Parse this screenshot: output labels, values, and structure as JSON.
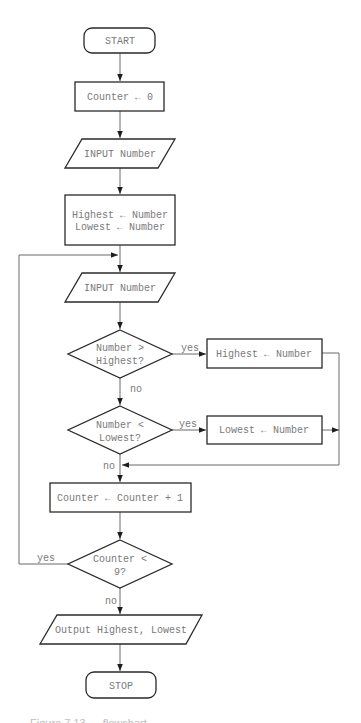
{
  "diagram": {
    "type": "flowchart",
    "nodes": {
      "start": {
        "shape": "terminator",
        "label": "START"
      },
      "init_counter": {
        "shape": "process",
        "label": "Counter ← 0"
      },
      "input_first": {
        "shape": "io",
        "label": "INPUT Number"
      },
      "init_minmax": {
        "shape": "process",
        "line1": "Highest ← Number",
        "line2": "Lowest ← Number"
      },
      "input_loop": {
        "shape": "io",
        "label": "INPUT Number"
      },
      "check_high": {
        "shape": "decision",
        "line1": "Number >",
        "line2": "Highest?"
      },
      "set_high": {
        "shape": "process",
        "label": "Highest ← Number"
      },
      "check_low": {
        "shape": "decision",
        "line1": "Number <",
        "line2": "Lowest?"
      },
      "set_low": {
        "shape": "process",
        "label": "Lowest ← Number"
      },
      "inc_counter": {
        "shape": "process",
        "label": "Counter ← Counter + 1"
      },
      "check_counter": {
        "shape": "decision",
        "line1": "Counter <",
        "line2": "9?"
      },
      "output": {
        "shape": "io",
        "label": "Output Highest, Lowest"
      },
      "stop": {
        "shape": "terminator",
        "label": "STOP"
      }
    },
    "edge_labels": {
      "high_yes": "yes",
      "high_no": "no",
      "low_yes": "yes",
      "low_no": "no",
      "counter_yes": "yes",
      "counter_no": "no"
    },
    "edges": [
      [
        "start",
        "init_counter"
      ],
      [
        "init_counter",
        "input_first"
      ],
      [
        "input_first",
        "init_minmax"
      ],
      [
        "init_minmax",
        "input_loop"
      ],
      [
        "input_loop",
        "check_high"
      ],
      [
        "check_high",
        "set_high",
        "yes"
      ],
      [
        "check_high",
        "check_low",
        "no"
      ],
      [
        "check_low",
        "set_low",
        "yes"
      ],
      [
        "check_low",
        "inc_counter",
        "no"
      ],
      [
        "set_high",
        "inc_counter"
      ],
      [
        "set_low",
        "inc_counter"
      ],
      [
        "inc_counter",
        "check_counter"
      ],
      [
        "check_counter",
        "input_loop",
        "yes"
      ],
      [
        "check_counter",
        "output",
        "no"
      ],
      [
        "output",
        "stop"
      ]
    ],
    "colors": {
      "outline": "#2a2a2a",
      "connector": "#6a6a6a",
      "text": "#7a7a7a",
      "background": "#ffffff"
    }
  },
  "caption": {
    "text": "Figure 7.13 … flowchart …",
    "note": "clipped at bottom edge"
  }
}
